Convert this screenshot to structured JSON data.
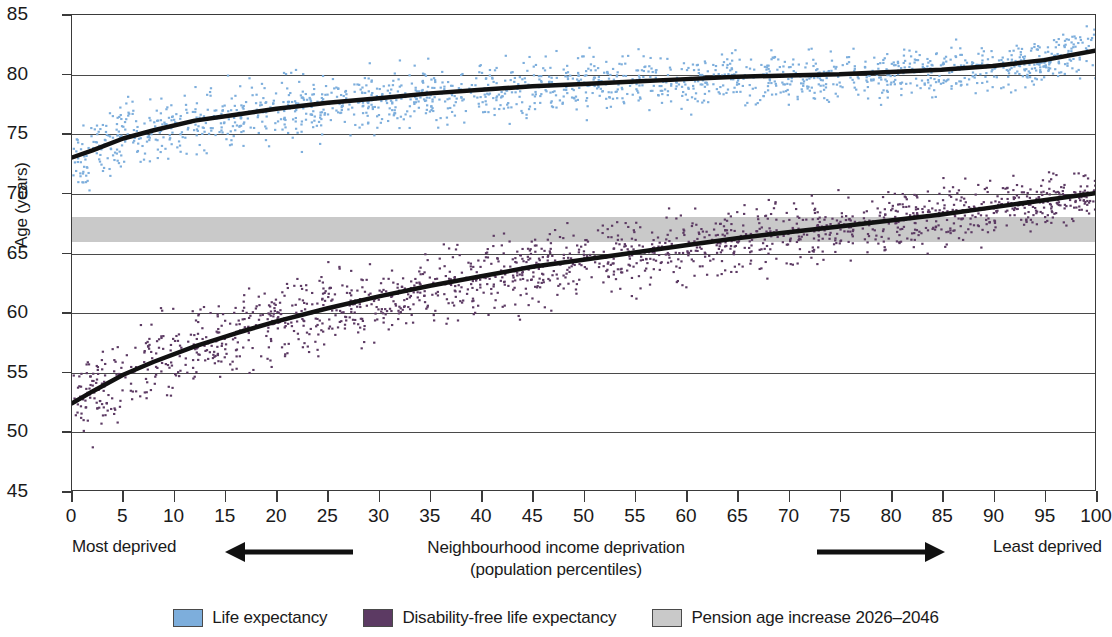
{
  "chart_data": {
    "type": "scatter",
    "title": "",
    "xlabel": "Neighbourhood income deprivation (population percentiles)",
    "xlabel_line1": "Neighbourhood income deprivation",
    "xlabel_line2": "(population percentiles)",
    "ylabel": "Age (years)",
    "xlim": [
      0,
      100
    ],
    "ylim": [
      45,
      85
    ],
    "grid": true,
    "legend_position": "bottom",
    "x_ticks": [
      0,
      5,
      10,
      15,
      20,
      25,
      30,
      35,
      40,
      45,
      50,
      55,
      60,
      65,
      70,
      75,
      80,
      85,
      90,
      95,
      100
    ],
    "y_ticks": [
      45,
      50,
      55,
      60,
      65,
      70,
      75,
      80,
      85
    ],
    "gridline_values": [
      50,
      55,
      60,
      65,
      70,
      75,
      80
    ],
    "axis_end_labels": {
      "left": "Most deprived",
      "right": "Least deprived"
    },
    "annotations": [
      {
        "name": "arrow-left",
        "direction": "left",
        "meaning": "towards most deprived"
      },
      {
        "name": "arrow-right",
        "direction": "right",
        "meaning": "towards least deprived"
      }
    ],
    "shaded_band": {
      "label": "Pension age increase 2026–2046",
      "y_from": 66.0,
      "y_to": 68.1,
      "color": "#c9c9c9"
    },
    "series": [
      {
        "name": "Life expectancy",
        "color": "#7DAEDC",
        "marker": "point",
        "trend_color": "#111111",
        "trend_description": "Rises steeply from 73.0 years at the most deprived percentile to about 79.5 by the 50th percentile, then gently to 82.0 at the least deprived percentile.",
        "trend_points": [
          {
            "x": 0,
            "y": 73.0
          },
          {
            "x": 2,
            "y": 73.6
          },
          {
            "x": 5,
            "y": 74.6
          },
          {
            "x": 8,
            "y": 75.3
          },
          {
            "x": 12,
            "y": 76.1
          },
          {
            "x": 16,
            "y": 76.6
          },
          {
            "x": 20,
            "y": 77.1
          },
          {
            "x": 25,
            "y": 77.6
          },
          {
            "x": 30,
            "y": 78.0
          },
          {
            "x": 35,
            "y": 78.4
          },
          {
            "x": 40,
            "y": 78.7
          },
          {
            "x": 45,
            "y": 79.0
          },
          {
            "x": 50,
            "y": 79.2
          },
          {
            "x": 55,
            "y": 79.4
          },
          {
            "x": 60,
            "y": 79.6
          },
          {
            "x": 65,
            "y": 79.8
          },
          {
            "x": 70,
            "y": 79.9
          },
          {
            "x": 75,
            "y": 80.0
          },
          {
            "x": 80,
            "y": 80.2
          },
          {
            "x": 85,
            "y": 80.4
          },
          {
            "x": 90,
            "y": 80.7
          },
          {
            "x": 95,
            "y": 81.2
          },
          {
            "x": 100,
            "y": 82.0
          }
        ],
        "scatter_spread": 2.4,
        "n_points": 1700
      },
      {
        "name": "Disability-free life expectancy",
        "color": "#5C3A63",
        "marker": "point",
        "trend_color": "#111111",
        "trend_description": "Rises from 52.3 years at the most deprived percentile through about 64.5 at the midpoint to 70.0 at the least deprived percentile.",
        "trend_points": [
          {
            "x": 0,
            "y": 52.3
          },
          {
            "x": 2,
            "y": 53.3
          },
          {
            "x": 5,
            "y": 54.7
          },
          {
            "x": 8,
            "y": 55.8
          },
          {
            "x": 12,
            "y": 57.1
          },
          {
            "x": 16,
            "y": 58.2
          },
          {
            "x": 20,
            "y": 59.2
          },
          {
            "x": 25,
            "y": 60.3
          },
          {
            "x": 30,
            "y": 61.3
          },
          {
            "x": 35,
            "y": 62.2
          },
          {
            "x": 40,
            "y": 63.0
          },
          {
            "x": 45,
            "y": 63.8
          },
          {
            "x": 50,
            "y": 64.4
          },
          {
            "x": 55,
            "y": 65.0
          },
          {
            "x": 60,
            "y": 65.6
          },
          {
            "x": 65,
            "y": 66.2
          },
          {
            "x": 70,
            "y": 66.7
          },
          {
            "x": 75,
            "y": 67.2
          },
          {
            "x": 80,
            "y": 67.7
          },
          {
            "x": 85,
            "y": 68.2
          },
          {
            "x": 90,
            "y": 68.8
          },
          {
            "x": 95,
            "y": 69.4
          },
          {
            "x": 100,
            "y": 70.0
          }
        ],
        "scatter_spread": 3.0,
        "n_points": 1700
      }
    ]
  },
  "legend": {
    "items": [
      {
        "label": "Life expectancy",
        "color": "#7DAEDC"
      },
      {
        "label": "Disability-free life expectancy",
        "color": "#5C3A63"
      },
      {
        "label": "Pension age increase 2026–2046",
        "color": "#c9c9c9"
      }
    ]
  }
}
